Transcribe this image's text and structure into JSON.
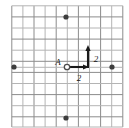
{
  "figure": {
    "type": "coordinate-grid-vector-diagram",
    "width": 129,
    "height": 128,
    "background_color": "#ffffff"
  },
  "grid": {
    "line_color": "#8c8c8c",
    "line_color_light": "#b4b4b4",
    "line_width": 1,
    "spacing_px": 11.1,
    "origin_x_px": 67,
    "origin_y_px": 67,
    "x_min_px": 11.8,
    "x_max_px": 122.8,
    "y_min_px": 5.8,
    "y_max_px": 127,
    "vertical_lines_px": [
      11.8,
      22.9,
      34.0,
      45.1,
      56.2,
      67.3,
      78.4,
      89.5,
      100.6,
      111.7,
      122.8
    ],
    "horizontal_lines_px": [
      5.8,
      16.9,
      28.0,
      39.1,
      50.2,
      61.3,
      67.3,
      72.4,
      83.5,
      94.6,
      105.7,
      116.8,
      127.0
    ]
  },
  "points": {
    "origin_label": "A",
    "origin_marker": "open-circle",
    "origin_marker_color": "#4d4d4d",
    "lattice_dot_color": "#3d3d3d",
    "lattice_dots": [
      {
        "name": "dot-top",
        "label": "",
        "x_px": 66,
        "y_px": 17,
        "grid_x": 0,
        "grid_y": 4.5
      },
      {
        "name": "dot-bottom",
        "label": "",
        "x_px": 66,
        "y_px": 118,
        "grid_x": 0,
        "grid_y": -4.6
      },
      {
        "name": "dot-left",
        "label": "",
        "x_px": 14,
        "y_px": 67,
        "grid_x": -4.8,
        "grid_y": 0
      },
      {
        "name": "dot-right",
        "label": "",
        "x_px": 112,
        "y_px": 67,
        "grid_x": 4.1,
        "grid_y": 0
      }
    ]
  },
  "vectors": [
    {
      "name": "horizontal-vector",
      "label": "2",
      "direction": "right",
      "color": "#1a1a1a",
      "from_x_px": 68,
      "from_y_px": 67,
      "to_x_px": 89,
      "to_y_px": 67,
      "length_units": 2,
      "label_x_px": 79,
      "label_y_px": 81
    },
    {
      "name": "vertical-vector",
      "label": "2",
      "direction": "up",
      "color": "#1a1a1a",
      "from_x_px": 88,
      "from_y_px": 68,
      "to_x_px": 88,
      "to_y_px": 45,
      "length_units": 2,
      "label_x_px": 96,
      "label_y_px": 62
    }
  ],
  "labels": {
    "point_a": "A",
    "point_a_x_px": 58,
    "point_a_y_px": 65,
    "horizontal_magnitude": "2",
    "vertical_magnitude": "2"
  }
}
